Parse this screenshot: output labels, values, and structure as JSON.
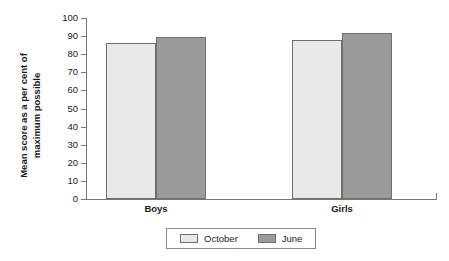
{
  "chart_data": {
    "type": "bar",
    "title": "",
    "xlabel": "",
    "ylabel": "Mean score as a per cent of maximum possible",
    "ylabel_line1": "Mean score as a per cent of",
    "ylabel_line2": "maximum possible",
    "categories": [
      "Boys",
      "Girls"
    ],
    "series": [
      {
        "name": "October",
        "values": [
          86,
          88
        ],
        "color": "#e9e9e9"
      },
      {
        "name": "June",
        "values": [
          89.5,
          91.5
        ],
        "color": "#9b9b9b"
      }
    ],
    "ylim": [
      0,
      100
    ],
    "yticks": [
      100,
      90,
      80,
      70,
      60,
      50,
      40,
      30,
      20,
      10,
      0
    ],
    "ytick_labels": [
      "100",
      "90",
      "80",
      "70",
      "60",
      "50",
      "40",
      "30",
      "20",
      "10",
      "0"
    ],
    "grid": false,
    "legend_position": "bottom-center",
    "legend_entries": [
      "October",
      "June"
    ]
  }
}
